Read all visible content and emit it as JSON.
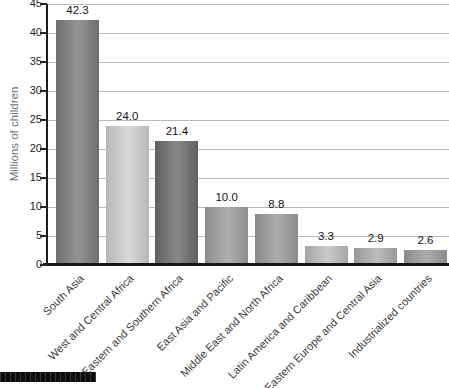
{
  "chart_data": {
    "type": "bar",
    "title": "",
    "xlabel": "",
    "ylabel": "Millions of children",
    "ylim": [
      0,
      45
    ],
    "yticks": [
      0,
      5,
      10,
      15,
      20,
      25,
      30,
      35,
      40,
      45
    ],
    "grid": true,
    "legend": false,
    "categories": [
      "South Asia",
      "West and Central Africa",
      "Eastern and Southern Africa",
      "East Asia and Pacific",
      "Middle East and North Africa",
      "Latin America and Caribbean",
      "Eastern Europe and Central Asia",
      "Industrialized countries"
    ],
    "values": [
      42.3,
      24.0,
      21.4,
      10.0,
      8.8,
      3.3,
      2.9,
      2.6
    ],
    "value_labels": [
      "42.3",
      "24.0",
      "21.4",
      "10.0",
      "8.8",
      "3.3",
      "2.9",
      "2.6"
    ],
    "bar_gradients": [
      {
        "edge": "#6e6e6e",
        "center": "#929292"
      },
      {
        "edge": "#b7b7b7",
        "center": "#d6d6d6"
      },
      {
        "edge": "#5f5f5f",
        "center": "#868686"
      },
      {
        "edge": "#8c8c8c",
        "center": "#acacac"
      },
      {
        "edge": "#898989",
        "center": "#aaaaaa"
      },
      {
        "edge": "#a5a5a5",
        "center": "#c7c7c7"
      },
      {
        "edge": "#989898",
        "center": "#bababa"
      },
      {
        "edge": "#8a8a8a",
        "center": "#ababab"
      }
    ]
  },
  "colors": {
    "grid": "#b7babb",
    "axis": "#1c1c1c",
    "ylabel_text": "#6b7682",
    "tick_text": "#262626",
    "value_text": "#141414",
    "category_text": "#3b3b3b",
    "footer_strip": "#0d0d0d"
  }
}
